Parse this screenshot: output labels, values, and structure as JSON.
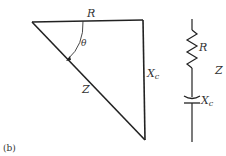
{
  "figure_label": "(b)",
  "impedance_triangle": {
    "sides": {
      "horizontal": "R",
      "vertical_main": "X",
      "vertical_sub": "c",
      "hypotenuse": "Z"
    },
    "angle": "θ"
  },
  "circuit": {
    "resistor_label": "R",
    "capacitor_label_main": "X",
    "capacitor_label_sub": "c",
    "total_label": "Z"
  }
}
